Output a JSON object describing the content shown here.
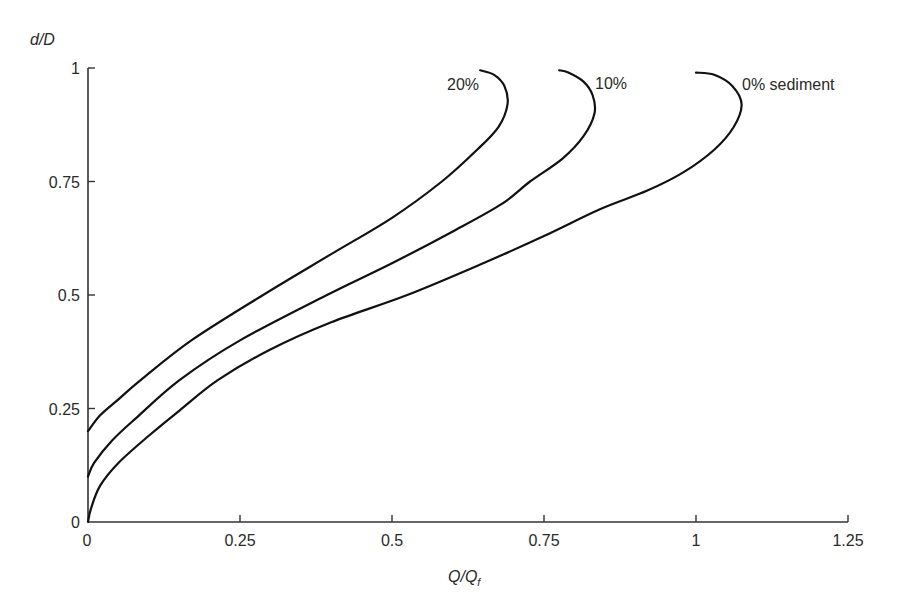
{
  "chart_data": {
    "type": "line",
    "title": "",
    "xlabel": "Q/Q",
    "xlabel_subscript": "f",
    "ylabel": "d/D",
    "xlim": [
      0,
      1.25
    ],
    "ylim": [
      0,
      1
    ],
    "grid": false,
    "legend_position": "inline labels at curve tops",
    "x_ticks": [
      "0",
      "0.25",
      "0.5",
      "0.75",
      "1",
      "1.25"
    ],
    "y_ticks": [
      "0",
      "0.25",
      "0.5",
      "0.75",
      "1"
    ],
    "series": [
      {
        "name": "0% sediment",
        "label": "0% sediment",
        "points": [
          [
            0,
            0
          ],
          [
            0.005,
            0.03
          ],
          [
            0.02,
            0.08
          ],
          [
            0.05,
            0.13
          ],
          [
            0.1,
            0.19
          ],
          [
            0.15,
            0.245
          ],
          [
            0.214,
            0.313
          ],
          [
            0.3,
            0.38
          ],
          [
            0.4,
            0.44
          ],
          [
            0.525,
            0.5
          ],
          [
            0.65,
            0.57
          ],
          [
            0.75,
            0.63
          ],
          [
            0.842,
            0.689
          ],
          [
            0.92,
            0.73
          ],
          [
            0.979,
            0.77
          ],
          [
            1.03,
            0.82
          ],
          [
            1.062,
            0.87
          ],
          [
            1.075,
            0.92
          ],
          [
            1.06,
            0.96
          ],
          [
            1.03,
            0.985
          ],
          [
            1.0,
            0.99
          ]
        ]
      },
      {
        "name": "10%",
        "label": "10%",
        "points": [
          [
            0,
            0.1
          ],
          [
            0.01,
            0.13
          ],
          [
            0.04,
            0.18
          ],
          [
            0.08,
            0.23
          ],
          [
            0.151,
            0.313
          ],
          [
            0.25,
            0.4
          ],
          [
            0.393,
            0.5
          ],
          [
            0.5,
            0.57
          ],
          [
            0.6,
            0.64
          ],
          [
            0.68,
            0.7
          ],
          [
            0.727,
            0.75
          ],
          [
            0.78,
            0.8
          ],
          [
            0.815,
            0.85
          ],
          [
            0.833,
            0.9
          ],
          [
            0.83,
            0.94
          ],
          [
            0.815,
            0.97
          ],
          [
            0.79,
            0.99
          ],
          [
            0.775,
            0.995
          ]
        ]
      },
      {
        "name": "20%",
        "label": "20%",
        "points": [
          [
            0,
            0.2
          ],
          [
            0.02,
            0.235
          ],
          [
            0.05,
            0.27
          ],
          [
            0.087,
            0.313
          ],
          [
            0.17,
            0.4
          ],
          [
            0.288,
            0.5
          ],
          [
            0.4,
            0.59
          ],
          [
            0.5,
            0.67
          ],
          [
            0.582,
            0.75
          ],
          [
            0.64,
            0.82
          ],
          [
            0.675,
            0.87
          ],
          [
            0.69,
            0.92
          ],
          [
            0.685,
            0.96
          ],
          [
            0.668,
            0.985
          ],
          [
            0.645,
            0.995
          ]
        ]
      }
    ]
  },
  "labels": {
    "y_axis_title": "d/D",
    "x_axis_title_main": "Q/Q",
    "x_axis_title_sub": "f",
    "curve_0": "0% sediment",
    "curve_10": "10%",
    "curve_20": "20%",
    "x_ticks": [
      "0",
      "0.25",
      "0.5",
      "0.75",
      "1",
      "1.25"
    ],
    "y_ticks": [
      "0",
      "0.25",
      "0.5",
      "0.75",
      "1"
    ]
  },
  "colors": {
    "line": "#111111",
    "axis": "#333333",
    "text": "#2a2a2a",
    "background": "#ffffff"
  }
}
